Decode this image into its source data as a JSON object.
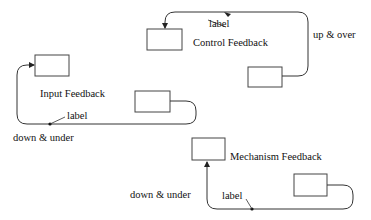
{
  "diagrams": {
    "control": {
      "title": "Control Feedback",
      "route_label": "up & over",
      "edge_label": "label"
    },
    "input": {
      "title": "Input Feedback",
      "route_label": "down & under",
      "edge_label": "label"
    },
    "mechanism": {
      "title": "Mechanism Feedback",
      "route_label": "down & under",
      "edge_label": "label"
    }
  },
  "colors": {
    "stroke": "#222222",
    "background": "#ffffff"
  }
}
